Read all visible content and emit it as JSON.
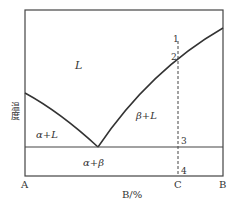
{
  "diagram": {
    "type": "binary eutectic phase diagram",
    "ylabel": "温度",
    "xlabel": "B/%",
    "axis_ticks": {
      "left": "A",
      "c": "C",
      "right": "B"
    },
    "regions": {
      "liquid": "L",
      "alpha_liquid": "α+L",
      "beta_liquid": "β+L",
      "alpha_beta": "α+β"
    },
    "points": {
      "p1": "1",
      "p2": "2",
      "p3": "3",
      "p4": "4"
    },
    "colors": {
      "line": "#333333",
      "background": "#ffffff"
    }
  }
}
